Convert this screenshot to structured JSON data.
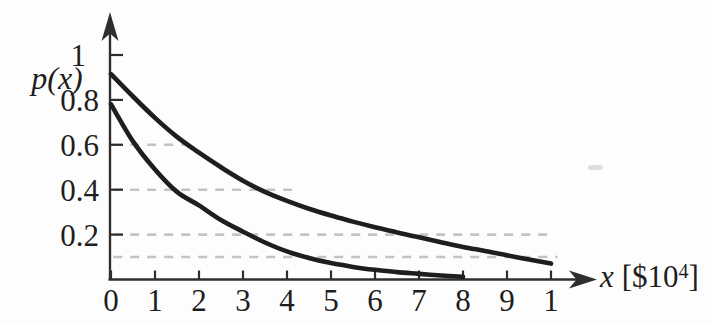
{
  "colors": {
    "background": "#fdfdfd",
    "ink": "#1e1e1e",
    "axis": "#2e2e2e",
    "grid": "#c3c3c3"
  },
  "labels": {
    "y_axis_title": "p(x)",
    "x_title_var": "x",
    "x_title_open": "[$10",
    "x_title_exp": "4",
    "x_title_close": "]"
  },
  "chart_data": {
    "type": "line",
    "title": "",
    "xlabel": "x [$10^4]",
    "ylabel": "p(x)",
    "xlim": [
      0,
      10.7
    ],
    "ylim": [
      0,
      1.15
    ],
    "legend": "none",
    "grid": "partial dashed horizontal lines at y=0.6, 0.4, 0.2, 0.1",
    "x_ticks": [
      {
        "v": 0,
        "label": "0"
      },
      {
        "v": 1,
        "label": "1"
      },
      {
        "v": 2,
        "label": "2"
      },
      {
        "v": 3,
        "label": "3"
      },
      {
        "v": 4,
        "label": "4"
      },
      {
        "v": 5,
        "label": "5"
      },
      {
        "v": 6,
        "label": "6"
      },
      {
        "v": 7,
        "label": "7"
      },
      {
        "v": 8,
        "label": "8"
      },
      {
        "v": 9,
        "label": "9"
      },
      {
        "v": 10,
        "label": "1"
      }
    ],
    "y_ticks": [
      {
        "v": 1,
        "label": "1",
        "dx": -13
      },
      {
        "v": 0.8,
        "label": "0.8"
      },
      {
        "v": 0.6,
        "label": "0.6"
      },
      {
        "v": 0.4,
        "label": "0.4"
      },
      {
        "v": 0.2,
        "label": "0.2"
      }
    ],
    "gridlines": [
      {
        "y": 0.6,
        "x_from": 0.05,
        "x_to": 1.7
      },
      {
        "y": 0.4,
        "x_from": 0.05,
        "x_to": 4.2
      },
      {
        "y": 0.2,
        "x_from": 0.05,
        "x_to": 10.0
      },
      {
        "y": 0.1,
        "x_from": 0.05,
        "x_to": 10.15
      }
    ],
    "series": [
      {
        "name": "upper-curve",
        "x": [
          0,
          0.5,
          1,
          1.5,
          2,
          2.5,
          3,
          3.5,
          4,
          4.5,
          5,
          5.5,
          6,
          6.5,
          7,
          7.5,
          8,
          8.5,
          9,
          9.5,
          10
        ],
        "y": [
          0.915,
          0.815,
          0.72,
          0.635,
          0.565,
          0.5,
          0.44,
          0.39,
          0.35,
          0.315,
          0.285,
          0.258,
          0.233,
          0.21,
          0.188,
          0.166,
          0.145,
          0.127,
          0.108,
          0.089,
          0.071
        ]
      },
      {
        "name": "lower-curve",
        "x": [
          0,
          0.5,
          1,
          1.5,
          2,
          2.5,
          3,
          3.5,
          4,
          4.5,
          5,
          5.5,
          6,
          6.5,
          7,
          7.5,
          8
        ],
        "y": [
          0.78,
          0.615,
          0.49,
          0.39,
          0.33,
          0.265,
          0.213,
          0.165,
          0.125,
          0.096,
          0.073,
          0.056,
          0.043,
          0.033,
          0.025,
          0.018,
          0.012
        ]
      }
    ]
  }
}
